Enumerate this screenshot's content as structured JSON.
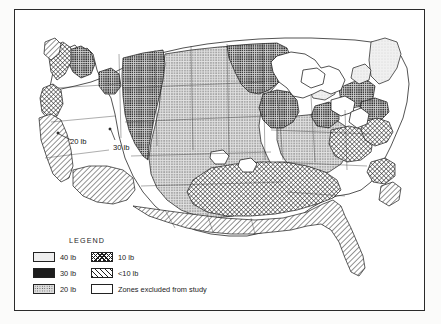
{
  "figure": {
    "kind": "thematic-isoline-map",
    "region": "Contiguous United States",
    "title": "",
    "border_color": "#2b2b2b",
    "background": "#ffffff"
  },
  "legend": {
    "title": "LEGEND",
    "columns": [
      {
        "items": [
          {
            "label": "40 lb",
            "pattern": "light-stipple",
            "swatch_class": "p40"
          },
          {
            "label": "30 lb",
            "pattern": "dark-dense-stipple",
            "swatch_class": "p30"
          },
          {
            "label": "20 lb",
            "pattern": "medium-stipple",
            "swatch_class": "p20"
          }
        ]
      },
      {
        "items": [
          {
            "label": "10 lb",
            "pattern": "crosshatch",
            "swatch_class": "p10"
          },
          {
            "label": "<10 lb",
            "pattern": "diagonal-hatch",
            "swatch_class": "plt10"
          },
          {
            "label": "Zones excluded from study",
            "pattern": "blank-white",
            "swatch_class": "pexcl"
          }
        ]
      }
    ]
  },
  "map_annotations": [
    {
      "label": "20 lb",
      "x": 58,
      "y": 131
    },
    {
      "label": "30 lb",
      "x": 100,
      "y": 137
    }
  ],
  "zones": {
    "classes": [
      "40 lb",
      "30 lb",
      "20 lb",
      "10 lb",
      "<10 lb",
      "Zones excluded from study"
    ],
    "colors": {
      "40 lb": "#eeeeee",
      "30 lb": "#cfcfcf",
      "20 lb": "#dedede",
      "10 lb": "#ffffff",
      "<10 lb": "#ffffff",
      "excluded": "#ffffff"
    }
  }
}
